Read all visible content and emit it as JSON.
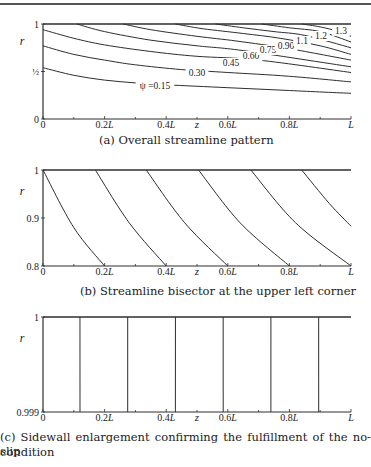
{
  "chart_data": [
    {
      "type": "line",
      "panel": "a",
      "title": "(a) Overall streamline pattern",
      "xlabel": "z",
      "ylabel": "r",
      "xlim": [
        0,
        1
      ],
      "ylim": [
        0,
        1
      ],
      "xticks": [
        "0",
        "0.2L",
        "0.4L",
        "0.6L",
        "0.8L",
        "L"
      ],
      "yticks": [
        "0",
        "½",
        "1"
      ],
      "grid": false,
      "series": [
        {
          "name": "ψ =0.15",
          "label": "ψ =0.15",
          "points": [
            [
              0,
              0.54
            ],
            [
              0.1,
              0.46
            ],
            [
              0.2,
              0.41
            ],
            [
              0.3,
              0.38
            ],
            [
              0.4,
              0.36
            ],
            [
              0.6,
              0.33
            ],
            [
              0.8,
              0.3
            ],
            [
              1.0,
              0.27
            ]
          ]
        },
        {
          "name": "0.30",
          "label": "0.30",
          "points": [
            [
              0,
              0.77
            ],
            [
              0.1,
              0.68
            ],
            [
              0.2,
              0.62
            ],
            [
              0.3,
              0.57
            ],
            [
              0.45,
              0.52
            ],
            [
              0.6,
              0.49
            ],
            [
              0.8,
              0.45
            ],
            [
              1.0,
              0.39
            ]
          ]
        },
        {
          "name": "0.45",
          "label": "0.45",
          "points": [
            [
              0,
              0.94
            ],
            [
              0.1,
              0.85
            ],
            [
              0.2,
              0.78
            ],
            [
              0.35,
              0.71
            ],
            [
              0.5,
              0.66
            ],
            [
              0.7,
              0.62
            ],
            [
              1.0,
              0.49
            ]
          ]
        },
        {
          "name": "0.60",
          "label": "0.60",
          "points": [
            [
              0.11,
              1.0
            ],
            [
              0.2,
              0.92
            ],
            [
              0.35,
              0.83
            ],
            [
              0.5,
              0.77
            ],
            [
              0.65,
              0.72
            ],
            [
              1.0,
              0.55
            ]
          ]
        },
        {
          "name": "0.75",
          "label": "0.75",
          "points": [
            [
              0.26,
              1.0
            ],
            [
              0.35,
              0.94
            ],
            [
              0.5,
              0.87
            ],
            [
              0.63,
              0.82
            ],
            [
              0.8,
              0.74
            ],
            [
              1.0,
              0.62
            ]
          ]
        },
        {
          "name": "0.90",
          "label": "0.90",
          "points": [
            [
              0.43,
              1.0
            ],
            [
              0.52,
              0.95
            ],
            [
              0.65,
              0.9
            ],
            [
              0.77,
              0.85
            ],
            [
              0.9,
              0.77
            ],
            [
              1.0,
              0.68
            ]
          ]
        },
        {
          "name": "1.1",
          "label": "1.1",
          "points": [
            [
              0.56,
              1.0
            ],
            [
              0.65,
              0.96
            ],
            [
              0.75,
              0.92
            ],
            [
              0.85,
              0.88
            ],
            [
              1.0,
              0.75
            ]
          ]
        },
        {
          "name": "1.2",
          "label": "1.2",
          "points": [
            [
              0.71,
              1.0
            ],
            [
              0.8,
              0.96
            ],
            [
              0.9,
              0.92
            ],
            [
              1.0,
              0.81
            ]
          ]
        },
        {
          "name": "1.3",
          "label": "1.3",
          "points": [
            [
              0.84,
              1.0
            ],
            [
              0.9,
              0.97
            ],
            [
              0.96,
              0.92
            ],
            [
              1.0,
              0.87
            ]
          ]
        }
      ]
    },
    {
      "type": "line",
      "panel": "b",
      "title": "(b) Streamline bisector at the upper left corner",
      "xlabel": "z",
      "ylabel": "r",
      "xlim": [
        0,
        1
      ],
      "ylim": [
        0.8,
        1
      ],
      "xticks": [
        "0",
        "0.2L",
        "0.4L",
        "0.6L",
        "0.8L",
        "L"
      ],
      "yticks": [
        "0.8",
        "0.9",
        "1"
      ],
      "grid": false,
      "series": [
        {
          "name": "s1",
          "points": [
            [
              0.0,
              1.0
            ],
            [
              0.1,
              0.88
            ],
            [
              0.2,
              0.8
            ]
          ]
        },
        {
          "name": "s2",
          "points": [
            [
              0.17,
              1.0
            ],
            [
              0.28,
              0.89
            ],
            [
              0.4,
              0.8
            ]
          ]
        },
        {
          "name": "s3",
          "points": [
            [
              0.335,
              1.0
            ],
            [
              0.46,
              0.89
            ],
            [
              0.6,
              0.8
            ]
          ]
        },
        {
          "name": "s4",
          "points": [
            [
              0.505,
              1.0
            ],
            [
              0.64,
              0.89
            ],
            [
              0.8,
              0.8
            ]
          ]
        },
        {
          "name": "s5",
          "points": [
            [
              0.675,
              1.0
            ],
            [
              0.82,
              0.89
            ],
            [
              1.0,
              0.8
            ]
          ]
        },
        {
          "name": "s6",
          "points": [
            [
              0.84,
              1.0
            ],
            [
              0.93,
              0.93
            ],
            [
              1.0,
              0.883
            ]
          ]
        }
      ]
    },
    {
      "type": "line",
      "panel": "c",
      "title": "(c) Sidewall enlargement confirming the fulfillment of the no-slip condition",
      "xlabel": "z",
      "ylabel": "r",
      "xlim": [
        0,
        1
      ],
      "ylim": [
        0.999,
        1
      ],
      "xticks": [
        "0",
        "0.2L",
        "0.4L",
        "0.6L",
        "0.8L",
        "L"
      ],
      "yticks": [
        "0.999",
        "1"
      ],
      "grid": false,
      "series": [
        {
          "name": "v1",
          "points": [
            [
              0.12,
              0.999
            ],
            [
              0.12,
              1.0
            ]
          ]
        },
        {
          "name": "v2",
          "points": [
            [
              0.275,
              0.999
            ],
            [
              0.275,
              1.0
            ]
          ]
        },
        {
          "name": "v3",
          "points": [
            [
              0.43,
              0.999
            ],
            [
              0.43,
              1.0
            ]
          ]
        },
        {
          "name": "v4",
          "points": [
            [
              0.585,
              0.999
            ],
            [
              0.585,
              1.0
            ]
          ]
        },
        {
          "name": "v5",
          "points": [
            [
              0.74,
              0.999
            ],
            [
              0.74,
              1.0
            ]
          ]
        },
        {
          "name": "v6",
          "points": [
            [
              0.895,
              0.999
            ],
            [
              0.895,
              1.0
            ]
          ]
        }
      ]
    }
  ],
  "captions": {
    "a": "(a) Overall streamline pattern",
    "b": "(b) Streamline bisector at the upper left corner",
    "c_line1": "(c) Sidewall enlargement confirming the fulfillment of the no-slip",
    "c_line2": "condition"
  },
  "axis": {
    "xlabel": "z",
    "ylabel": "r",
    "xticks": [
      "0",
      "0.2L",
      "0.4L",
      "0.6L",
      "0.8L",
      "L"
    ],
    "a_yticks": {
      "bottom": "0",
      "mid": "½",
      "top": "1"
    },
    "b_yticks": {
      "bottom": "0.8",
      "mid": "0.9",
      "top": "1"
    },
    "c_yticks": {
      "bottom": "0.999",
      "top": "1"
    }
  },
  "labels_a": [
    "ψ =0.15",
    "0.30",
    "0.45",
    "0.60",
    "0.75",
    "0.90",
    "1.1",
    "1.2",
    "1.3"
  ],
  "colors": {
    "line": "#2e2e2e",
    "text": "#222222",
    "background": "#ffffff"
  }
}
